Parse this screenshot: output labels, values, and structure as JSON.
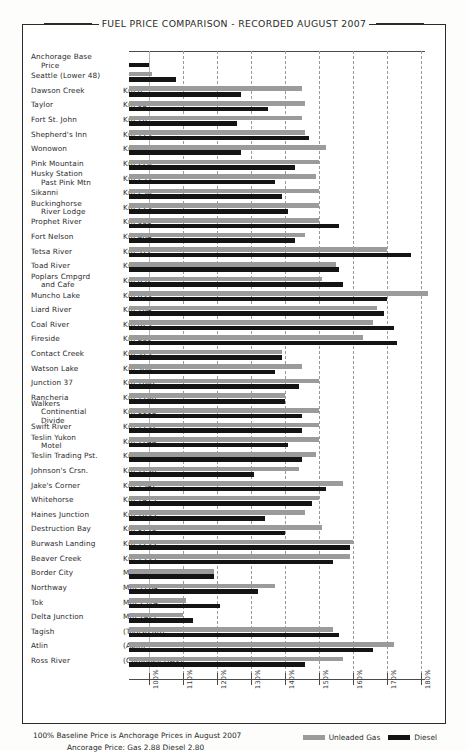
{
  "title": "FUEL PRICE COMPARISON - RECORDED AUGUST 2007",
  "footer": {
    "line1": "100% Baseline Price is Anchorage Prices in August 2007",
    "line2": "Ancorage Price:  Gas 2.88      Diesel 2.80"
  },
  "legend": {
    "gas_label": "Unleaded Gas",
    "diesel_label": "Diesel",
    "gas_color": "#9b9b9b",
    "diesel_color": "#141414",
    "position": "bottom-right"
  },
  "chart_data": {
    "type": "bar",
    "orientation": "horizontal",
    "title": "FUEL PRICE COMPARISON - RECORDED AUGUST 2007",
    "xlabel": "",
    "ylabel": "",
    "xlim": [
      94,
      182
    ],
    "grid": true,
    "axis_ticks": [
      "100%",
      "110%",
      "120%",
      "130%",
      "140%",
      "150%",
      "160%",
      "170%",
      "180%"
    ],
    "axis_tick_values": [
      100,
      110,
      120,
      130,
      140,
      150,
      160,
      170,
      180
    ],
    "baseline": 100,
    "bar_start": 94,
    "series": [
      {
        "name": "Unleaded Gas",
        "color": "#9b9b9b"
      },
      {
        "name": "Diesel",
        "color": "#141414"
      }
    ],
    "categories": [
      {
        "name": "Anchorage Base",
        "name2": "Price",
        "km": "",
        "gas": null,
        "diesel": 100
      },
      {
        "name": "Seattle (Lower 48)",
        "name2": "",
        "km": "",
        "gas": 101,
        "diesel": 108
      },
      {
        "name": "Dawson Creek",
        "name2": "",
        "km": "Km 0",
        "gas": 145,
        "diesel": 127
      },
      {
        "name": "Taylor",
        "name2": "",
        "km": "Km 58",
        "gas": 146,
        "diesel": 135
      },
      {
        "name": "Fort St. John",
        "name2": "",
        "km": "Km 76",
        "gas": 145,
        "diesel": 126
      },
      {
        "name": "Shepherd's Inn",
        "name2": "",
        "km": "Km 115",
        "gas": 146,
        "diesel": 147
      },
      {
        "name": "Wonowon",
        "name2": "",
        "km": "Km 162",
        "gas": 152,
        "diesel": 127
      },
      {
        "name": "Pink Mountain",
        "name2": "",
        "km": "Km 226",
        "gas": 150,
        "diesel": 143
      },
      {
        "name": "Husky Station",
        "name2": "Past Pink Mtn",
        "km": "Km 233",
        "gas": 149,
        "diesel": 137
      },
      {
        "name": "Sikanni",
        "name2": "",
        "km": "Km 256",
        "gas": 150,
        "diesel": 139
      },
      {
        "name": "Buckinghorse",
        "name2": "River Lodge",
        "km": "Km 279",
        "gas": 150,
        "diesel": 141
      },
      {
        "name": "Prophet River",
        "name2": "",
        "km": "Km 365",
        "gas": 150,
        "diesel": 156
      },
      {
        "name": "Fort Nelson",
        "name2": "",
        "km": "Km 464",
        "gas": 146,
        "diesel": 143
      },
      {
        "name": "Tetsa River",
        "name2": "",
        "km": "Km 572",
        "gas": 170,
        "diesel": 177
      },
      {
        "name": "Toad River",
        "name2": "",
        "km": "Km 647",
        "gas": 155,
        "diesel": 156
      },
      {
        "name": "Poplars Cmpgrd",
        "name2": "and Cafe",
        "km": "Km 652",
        "gas": 151,
        "diesel": 157
      },
      {
        "name": "Muncho Lake",
        "name2": "",
        "km": "Km 699",
        "gas": 182,
        "diesel": 170
      },
      {
        "name": "Liard River",
        "name2": "",
        "km": "Km 764",
        "gas": 167,
        "diesel": 169
      },
      {
        "name": "Coal River",
        "name2": "",
        "km": "Km 823",
        "gas": 166,
        "diesel": 172
      },
      {
        "name": "Fireside",
        "name2": "",
        "km": "Km 839",
        "gas": 163,
        "diesel": 173
      },
      {
        "name": "Contact Creek",
        "name2": "",
        "km": "Km 913",
        "gas": 139,
        "diesel": 139
      },
      {
        "name": "Watson Lake",
        "name2": "",
        "km": "Km 980",
        "gas": 145,
        "diesel": 137
      },
      {
        "name": "Junction 37",
        "name2": "",
        "km": "Km 1002",
        "gas": 150,
        "diesel": 144
      },
      {
        "name": "Rancheria",
        "name2": "",
        "km": "Km 1100",
        "gas": 140,
        "diesel": 140
      },
      {
        "name": "Walkers",
        "name2": "Continential",
        "name3": "Divide",
        "km": "Km 1118",
        "gas": 150,
        "diesel": 145
      },
      {
        "name": "Swift River",
        "name2": "",
        "km": "Km 1137",
        "gas": 150,
        "diesel": 145
      },
      {
        "name": "Teslin Yukon",
        "name2": "Motel",
        "km": "Km 1244",
        "gas": 150,
        "diesel": 141
      },
      {
        "name": "Teslin Trading Pst.",
        "name2": "",
        "km": "Km 1244",
        "gas": 149,
        "diesel": 145
      },
      {
        "name": "Johnson's Crsn.",
        "name2": "",
        "km": "Km 1296",
        "gas": 144,
        "diesel": 131
      },
      {
        "name": "Jake's Corner",
        "name2": "",
        "km": "Km 1342",
        "gas": 157,
        "diesel": 152
      },
      {
        "name": "Whitehorse",
        "name2": "",
        "km": "Km 1415",
        "gas": 150,
        "diesel": 148
      },
      {
        "name": "Haines Junction",
        "name2": "",
        "km": "Km 1635",
        "gas": 146,
        "diesel": 134
      },
      {
        "name": "Destruction Bay",
        "name2": "",
        "km": "Km 1743",
        "gas": 151,
        "diesel": 140
      },
      {
        "name": "Burwash Landing",
        "name2": "",
        "km": "Km 1759",
        "gas": 160,
        "diesel": 159
      },
      {
        "name": "Beaver Creek",
        "name2": "",
        "km": "Km 1935",
        "gas": 159,
        "diesel": 154
      },
      {
        "name": "Border City",
        "name2": "",
        "km": "Mm 1225",
        "gas": 119,
        "diesel": 119
      },
      {
        "name": "Northway",
        "name2": "",
        "km": "Mm 1264",
        "gas": 137,
        "diesel": 132
      },
      {
        "name": "Tok",
        "name2": "",
        "km": "Mm 1314",
        "gas": 111,
        "diesel": 121
      },
      {
        "name": "Delta Junction",
        "name2": "",
        "km": "Mm 1422",
        "gas": 110,
        "diesel": 113
      },
      {
        "name": "Tagish",
        "name2": "",
        "km": "(Tagish Rd)",
        "gas": 154,
        "diesel": 156
      },
      {
        "name": "Atlin",
        "name2": "",
        "km": "(Atlin)",
        "gas": 172,
        "diesel": 166
      },
      {
        "name": "Ross River",
        "name2": "",
        "km": "(Campbell Hwy)",
        "gas": 157,
        "diesel": 146
      }
    ]
  }
}
